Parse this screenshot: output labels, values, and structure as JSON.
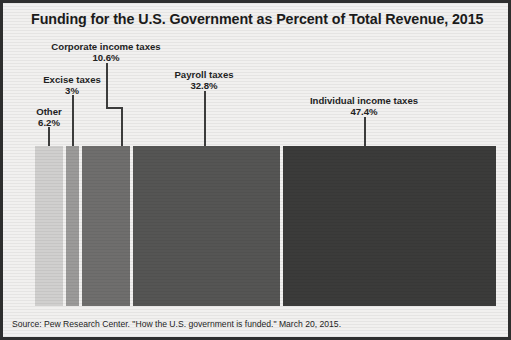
{
  "chart_data": {
    "type": "bar",
    "orientation": "stacked-horizontal-100",
    "title": "Funding for the U.S. Government as Percent of Total Revenue, 2015",
    "xlabel": "",
    "ylabel": "",
    "grid": false,
    "legend": "none",
    "value_suffix": "%",
    "total": 100,
    "categories": [
      "Other",
      "Excise taxes",
      "Corporate income taxes",
      "Payroll taxes",
      "Individual income taxes"
    ],
    "values": [
      6.2,
      3,
      10.6,
      32.8,
      47.4
    ],
    "value_labels": [
      "6.2%",
      "3%",
      "10.6%",
      "32.8%",
      "47.4%"
    ],
    "colors": [
      "#d0cfce",
      "#9b9a99",
      "#6f6e6d",
      "#555554",
      "#3b3b3a"
    ],
    "segments": [
      {
        "name": "Other",
        "value": 6.2,
        "value_label": "6.2%",
        "color": "#d0cfce"
      },
      {
        "name": "Excise taxes",
        "value": 3,
        "value_label": "3%",
        "color": "#9b9a99"
      },
      {
        "name": "Corporate income taxes",
        "value": 10.6,
        "value_label": "10.6%",
        "color": "#6f6e6d"
      },
      {
        "name": "Payroll taxes",
        "value": 32.8,
        "value_label": "32.8%",
        "color": "#555554"
      },
      {
        "name": "Individual income taxes",
        "value": 47.4,
        "value_label": "47.4%",
        "color": "#3b3b3a"
      }
    ],
    "source": "Source: Pew Research Center. \"How the U.S. government is funded.\" March 20, 2015."
  },
  "figure": {
    "title": "Funding for the U.S. Government as Percent of Total Revenue, 2015",
    "source": "Source: Pew Research Center. \"How the U.S. government is funded.\" March 20, 2015."
  },
  "labels": {
    "other": {
      "name": "Other",
      "value": "6.2%"
    },
    "excise": {
      "name": "Excise taxes",
      "value": "3%"
    },
    "corporate": {
      "name": "Corporate income taxes",
      "value": "10.6%"
    },
    "payroll": {
      "name": "Payroll taxes",
      "value": "32.8%"
    },
    "individual": {
      "name": "Individual income taxes",
      "value": "47.4%"
    }
  },
  "style": {
    "border_color": "#2e2e2e",
    "background": "#f1f0ef",
    "text_color": "#1b1b1b",
    "leader_color": "#3d3d3d"
  }
}
